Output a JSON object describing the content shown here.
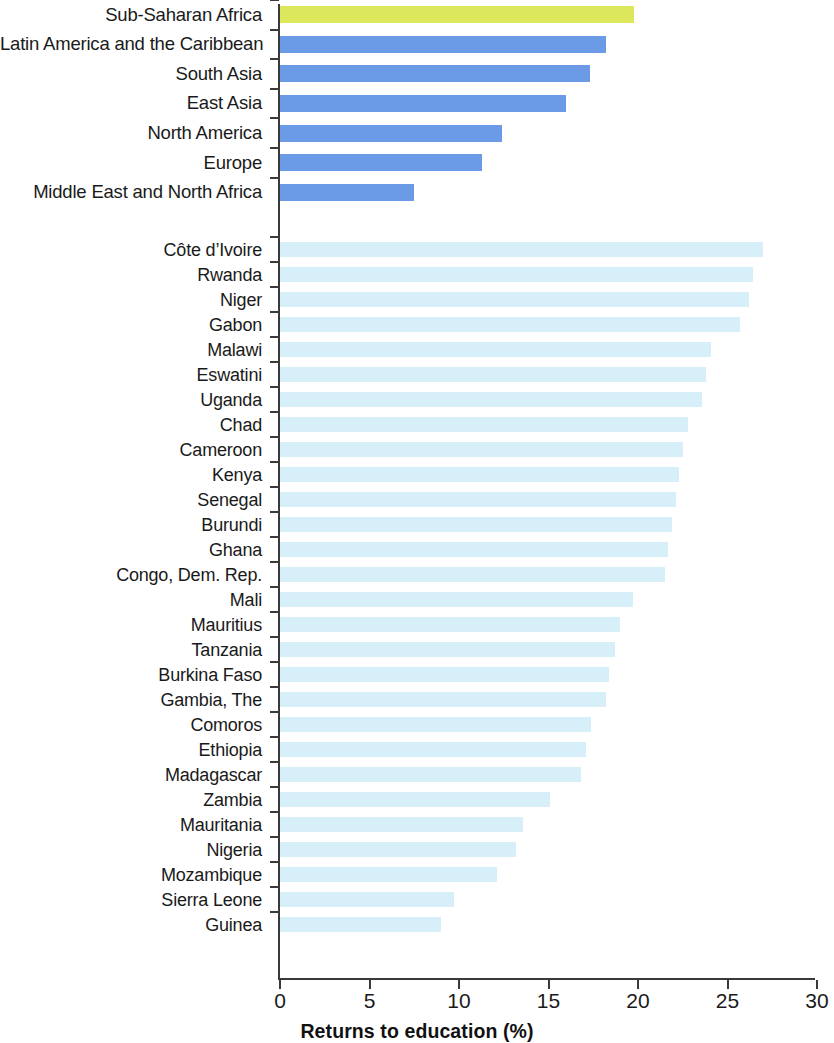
{
  "chart_data": {
    "type": "bar",
    "orientation": "horizontal",
    "title": "",
    "xlabel": "Returns to education (%)",
    "ylabel": "",
    "xlim": [
      0,
      30
    ],
    "xticks": [
      0,
      5,
      10,
      15,
      20,
      25,
      30
    ],
    "xtick_labels": [
      "0",
      "5",
      "10",
      "15",
      "20",
      "25",
      "30"
    ],
    "grid": false,
    "legend": "none",
    "colors": {
      "highlight": "#dde75c",
      "region": "#6b9ae6",
      "country": "#d7eff9",
      "axis": "#3a3a3a",
      "text": "#1a1a1a"
    },
    "groups": [
      {
        "name": "regions",
        "categories": [
          "Sub-Saharan Africa",
          "Latin America and the Caribbean",
          "South Asia",
          "East Asia",
          "North America",
          "Europe",
          "Middle East and North Africa"
        ],
        "values": [
          19.8,
          18.2,
          17.3,
          16.0,
          12.4,
          11.3,
          7.5
        ],
        "styles": [
          "highlight",
          "region",
          "region",
          "region",
          "region",
          "region",
          "region"
        ]
      },
      {
        "name": "countries",
        "categories": [
          "Côte d’Ivoire",
          "Rwanda",
          "Niger",
          "Gabon",
          "Malawi",
          "Eswatini",
          "Uganda",
          "Chad",
          "Cameroon",
          "Kenya",
          "Senegal",
          "Burundi",
          "Ghana",
          "Congo, Dem. Rep.",
          "Mali",
          "Mauritius",
          "Tanzania",
          "Burkina Faso",
          "Gambia, The",
          "Comoros",
          "Ethiopia",
          "Madagascar",
          "Zambia",
          "Mauritania",
          "Nigeria",
          "Mozambique",
          "Sierra Leone",
          "Guinea"
        ],
        "values": [
          27.0,
          26.4,
          26.2,
          25.7,
          24.1,
          23.8,
          23.6,
          22.8,
          22.5,
          22.3,
          22.1,
          21.9,
          21.7,
          21.5,
          19.7,
          19.0,
          18.7,
          18.4,
          18.2,
          17.4,
          17.1,
          16.8,
          15.1,
          13.6,
          13.2,
          12.1,
          9.7,
          9.0
        ],
        "styles": [
          "country",
          "country",
          "country",
          "country",
          "country",
          "country",
          "country",
          "country",
          "country",
          "country",
          "country",
          "country",
          "country",
          "country",
          "country",
          "country",
          "country",
          "country",
          "country",
          "country",
          "country",
          "country",
          "country",
          "country",
          "country",
          "country",
          "country",
          "country"
        ]
      }
    ]
  }
}
